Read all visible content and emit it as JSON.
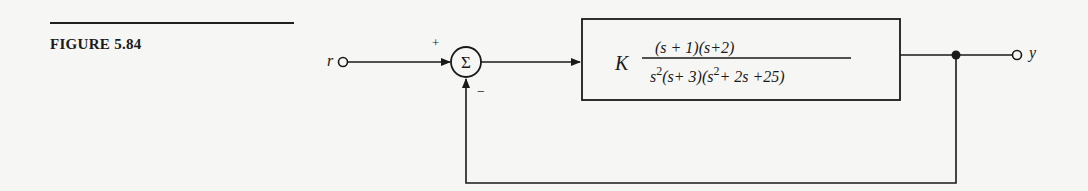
{
  "figure": {
    "label": "FIGURE 5.84"
  },
  "diagram": {
    "type": "unity feedback block diagram",
    "input": {
      "label": "r"
    },
    "output": {
      "label": "y"
    },
    "summing_junction": {
      "symbol": "Σ",
      "plus_sign": "+",
      "minus_sign": "−"
    },
    "plant": {
      "gain": "K",
      "numerator": "(s + 1)(s+2)",
      "denominator_parts": {
        "s": "s",
        "exp1": "2",
        "mid": "(s+ 3)(s",
        "exp2": "2",
        "tail": "+ 2s +25)"
      },
      "transfer_function": "K (s+1)(s+2) / [s^2 (s+3)(s^2+2s+25)]"
    },
    "feedback": "unity negative feedback"
  },
  "colors": {
    "background": "#f6f6f4",
    "ink": "#1a1a1a"
  }
}
